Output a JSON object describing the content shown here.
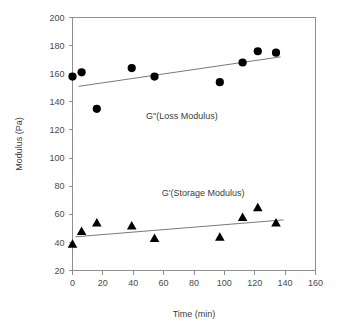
{
  "chart_data": {
    "type": "scatter",
    "title": "",
    "xlabel": "Time (min)",
    "ylabel": "Modulus (Pa)",
    "xlim": [
      0,
      160
    ],
    "ylim": [
      20,
      200
    ],
    "xticks": [
      0,
      20,
      40,
      60,
      80,
      100,
      120,
      140,
      160
    ],
    "yticks": [
      20,
      40,
      60,
      80,
      100,
      120,
      140,
      160,
      180,
      200
    ],
    "grid": false,
    "legend_position": "inline-annotation",
    "series": [
      {
        "name": "G\"(Loss Modulus)",
        "marker": "circle",
        "color": "#000000",
        "annotation": "G\"(Loss Modulus)",
        "annotation_x": 72,
        "annotation_y": 128,
        "x": [
          0,
          6,
          16,
          39,
          54,
          97,
          112,
          122,
          134
        ],
        "y": [
          158,
          161,
          135,
          164,
          158,
          154,
          168,
          176,
          175
        ],
        "trend": {
          "x1": 4,
          "y1": 151,
          "x2": 137,
          "y2": 172
        }
      },
      {
        "name": "G'(Storage Modulus)",
        "marker": "triangle",
        "color": "#000000",
        "annotation": "G'(Storage Modulus)",
        "annotation_x": 86,
        "annotation_y": 73,
        "x": [
          0,
          6,
          16,
          39,
          54,
          97,
          112,
          122,
          134
        ],
        "y": [
          39,
          48,
          54,
          52,
          43,
          44,
          58,
          65,
          54
        ],
        "trend": {
          "x1": 2,
          "y1": 44,
          "x2": 139,
          "y2": 56
        }
      }
    ]
  },
  "axes": {
    "x_title": "Time (min)",
    "y_title": "Modulus (Pa)"
  }
}
